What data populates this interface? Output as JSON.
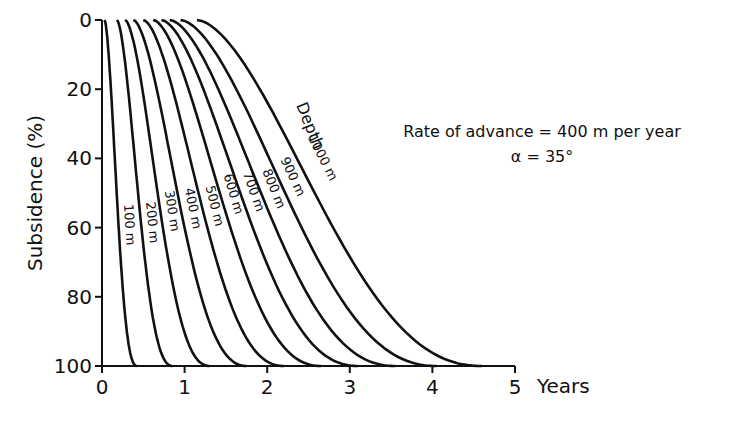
{
  "chart_data": {
    "type": "line",
    "title": "",
    "xlabel": "Years",
    "ylabel": "Subsidence (%)",
    "xlim": [
      0,
      5
    ],
    "ylim": [
      0,
      100
    ],
    "y_inverted": true,
    "grid": false,
    "x_ticks": [
      "0",
      "1",
      "2",
      "3",
      "4",
      "5"
    ],
    "y_ticks": [
      "0",
      "20",
      "40",
      "60",
      "80",
      "100"
    ],
    "annotations": {
      "rate": "Rate of advance = 400 m per year",
      "alpha": "α = 35°",
      "depth_label": "Depth"
    },
    "series": [
      {
        "name": "100 m",
        "label": "100 m",
        "start": 0.03,
        "end": 0.42
      },
      {
        "name": "200 m",
        "label": "200 m",
        "start": 0.18,
        "end": 0.85
      },
      {
        "name": "300 m",
        "label": "300 m",
        "start": 0.28,
        "end": 1.3
      },
      {
        "name": "400 m",
        "label": "400 m",
        "start": 0.38,
        "end": 1.75
      },
      {
        "name": "500 m",
        "label": "500 m",
        "start": 0.5,
        "end": 2.2
      },
      {
        "name": "600 m",
        "label": "600 m",
        "start": 0.62,
        "end": 2.65
      },
      {
        "name": "700 m",
        "label": "700 m",
        "start": 0.72,
        "end": 3.1
      },
      {
        "name": "800 m",
        "label": "800 m",
        "start": 0.82,
        "end": 3.55
      },
      {
        "name": "900 m",
        "label": "900 m",
        "start": 0.95,
        "end": 4.05
      },
      {
        "name": "1000 m",
        "label": "1000 m",
        "start": 1.15,
        "end": 4.6
      }
    ]
  }
}
